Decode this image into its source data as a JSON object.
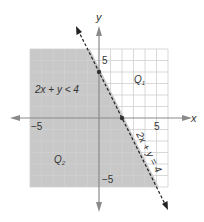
{
  "figure": {
    "inequality_label": "2x + y < 4",
    "boundary_label": "2x + y = 4",
    "region_unshaded_label": "Q",
    "region_unshaded_sub": "1",
    "region_shaded_label": "Q",
    "region_shaded_sub": "2",
    "x_axis_label": "x",
    "y_axis_label": "y",
    "tick_x_neg": "−5",
    "tick_x_pos": "5",
    "tick_y_pos": "5",
    "tick_y_neg": "−5",
    "points": [
      {
        "x": 0,
        "y": 4
      },
      {
        "x": 2,
        "y": 0
      }
    ],
    "colors": {
      "shade": "#c8c8c8",
      "grid": "#d0d0d0",
      "grid_shaded": "#b4b4b4",
      "axis": "#8a8a8a",
      "line": "#222222"
    }
  }
}
